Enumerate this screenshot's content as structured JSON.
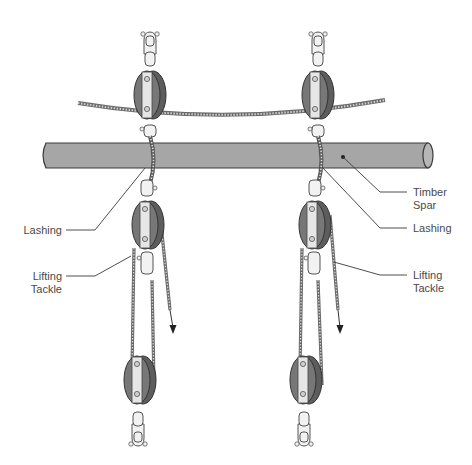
{
  "figure": {
    "type": "rigging-diagram"
  },
  "labels": {
    "timber_spar": {
      "line1": "Timber",
      "line2": "Spar"
    },
    "lashing_left": {
      "line1": "Lashing"
    },
    "lashing_right": {
      "line1": "Lashing"
    },
    "lifting_tackle_left": {
      "line1": "Lifting",
      "line2": "Tackle"
    },
    "lifting_tackle_right": {
      "line1": "Lifting",
      "line2": "Tackle"
    }
  },
  "colors": {
    "spar_fill": "#a6a6a6",
    "spar_stroke": "#3a3a3a",
    "pulley_shell": "#6e6e6e",
    "pulley_plate": "#e4e4e4",
    "rope": "#8a8a8a",
    "leader_line": "#3a3a3a",
    "label_text": "#4a4a4a"
  },
  "tackles": [
    {
      "id": "left",
      "x": 148
    },
    {
      "id": "right",
      "x": 318
    }
  ]
}
